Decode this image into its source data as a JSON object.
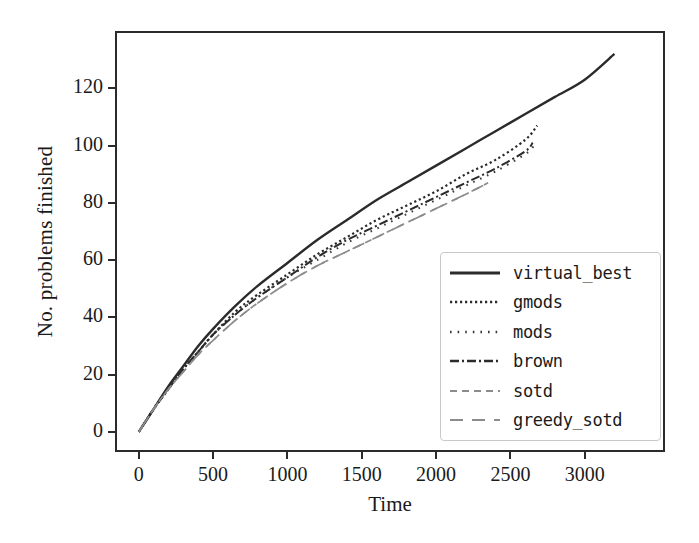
{
  "chart_data": {
    "type": "line",
    "title": "",
    "xlabel": "Time",
    "ylabel": "No. problems finished",
    "xlim": [
      -160,
      3540
    ],
    "ylim": [
      -7,
      140
    ],
    "xticks": [
      0,
      500,
      1000,
      1500,
      2000,
      2500,
      3000
    ],
    "yticks": [
      0,
      20,
      40,
      60,
      80,
      100,
      120
    ],
    "grid": false,
    "legend_position": "lower right",
    "series": [
      {
        "name": "virtual_best",
        "style": "solid",
        "color": "#2b2b2b",
        "x": [
          0,
          100,
          200,
          300,
          400,
          500,
          650,
          800,
          1000,
          1200,
          1400,
          1600,
          1800,
          2000,
          2200,
          2400,
          2600,
          2800,
          3000,
          3200
        ],
        "y": [
          0,
          8,
          16,
          23,
          30,
          36,
          44,
          51,
          59,
          67,
          74,
          81,
          87,
          93,
          99,
          105,
          111,
          117,
          123,
          132
        ]
      },
      {
        "name": "gmods",
        "style": "dotted",
        "color": "#2b2b2b",
        "x": [
          0,
          100,
          200,
          300,
          400,
          500,
          650,
          800,
          1000,
          1200,
          1400,
          1600,
          1800,
          2000,
          2200,
          2400,
          2600,
          2680
        ],
        "y": [
          0,
          8,
          15,
          22,
          28,
          34,
          42,
          48,
          55,
          62,
          68,
          74,
          79,
          84,
          90,
          95,
          102,
          107
        ]
      },
      {
        "name": "mods",
        "style": "dotted-sparse",
        "color": "#3a3a3a",
        "x": [
          0,
          100,
          200,
          300,
          400,
          500,
          650,
          800,
          1000,
          1200,
          1400,
          1600,
          1800,
          2000,
          2200,
          2400,
          2600,
          2660
        ],
        "y": [
          0,
          8,
          15,
          22,
          28,
          34,
          41,
          47,
          54,
          60,
          66,
          71,
          76,
          81,
          86,
          91,
          97,
          100
        ]
      },
      {
        "name": "brown",
        "style": "dashdot",
        "color": "#2b2b2b",
        "x": [
          0,
          100,
          200,
          300,
          400,
          500,
          650,
          800,
          1000,
          1200,
          1400,
          1600,
          1800,
          2000,
          2200,
          2400,
          2600,
          2650
        ],
        "y": [
          0,
          8,
          15,
          22,
          28,
          34,
          41,
          47,
          54,
          61,
          67,
          72,
          77,
          82,
          87,
          92,
          98,
          101
        ]
      },
      {
        "name": "sotd",
        "style": "fine-dash",
        "color": "#8c8c8c",
        "x": [
          0,
          100,
          200,
          300,
          400,
          500,
          650,
          800,
          1000,
          1200,
          1400,
          1600,
          1800,
          2000,
          2200,
          2350
        ],
        "y": [
          0,
          8,
          15,
          21,
          27,
          32,
          39,
          45,
          52,
          58,
          63,
          68,
          73,
          78,
          83,
          87
        ]
      },
      {
        "name": "greedy_sotd",
        "style": "long-dash",
        "color": "#8c8c8c",
        "x": [
          0,
          100,
          200,
          300,
          400,
          500,
          650,
          800,
          1000,
          1200,
          1400,
          1600,
          1800,
          2000,
          2200,
          2350
        ],
        "y": [
          0,
          8,
          15,
          21,
          27,
          32,
          39,
          45,
          52,
          58,
          63,
          68,
          73,
          78,
          83,
          87
        ]
      }
    ]
  },
  "axes": {
    "ylabel": "No. problems finished",
    "xlabel": "Time",
    "ytick_labels": [
      "120",
      "100",
      "80",
      "60",
      "40",
      "20",
      "0"
    ],
    "xtick_labels": [
      "0",
      "500",
      "1000",
      "1500",
      "2000",
      "2500",
      "3000"
    ]
  },
  "legend": {
    "entries": [
      {
        "label": "virtual_best",
        "style": "solid"
      },
      {
        "label": "gmods",
        "style": "dotted"
      },
      {
        "label": "mods",
        "style": "dotted-sparse"
      },
      {
        "label": "brown",
        "style": "dashdot"
      },
      {
        "label": "sotd",
        "style": "fine-dash"
      },
      {
        "label": "greedy_sotd",
        "style": "long-dash"
      }
    ]
  },
  "colors": {
    "axis": "#2b2b2b",
    "dark_line": "#2b2b2b",
    "light_line": "#8c8c8c",
    "legend_border": "#c9c9c9",
    "background": "#ffffff"
  }
}
